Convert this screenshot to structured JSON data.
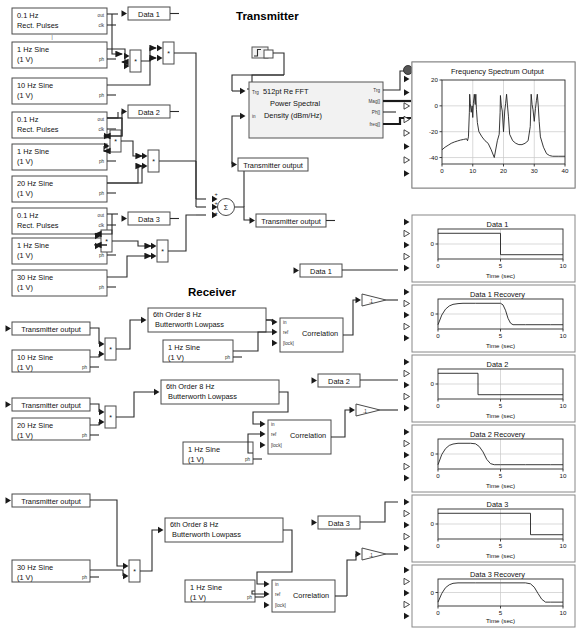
{
  "sections": {
    "transmitter_title": "Transmitter",
    "receiver_title": "Receiver"
  },
  "transmitter": {
    "sources": [
      {
        "id": "src_tx1_pulse",
        "line1": "0.1 Hz",
        "line2": "Rect. Pulses",
        "port_out": "out",
        "port_clk": "clk"
      },
      {
        "id": "src_tx1_s1",
        "line1": "1 Hz Sine",
        "line2": "(1 V)",
        "port_ph": "ph"
      },
      {
        "id": "src_tx1_s10",
        "line1": "10 Hz Sine",
        "line2": "(1 V)",
        "port_ph": "ph"
      },
      {
        "id": "src_tx2_pulse",
        "line1": "0.1 Hz",
        "line2": "Rect. Pulses",
        "port_out": "out",
        "port_clk": "clk"
      },
      {
        "id": "src_tx2_s1",
        "line1": "1 Hz Sine",
        "line2": "(1 V)",
        "port_ph": "ph"
      },
      {
        "id": "src_tx2_s20",
        "line1": "20 Hz Sine",
        "line2": "(1 V)",
        "port_ph": "ph"
      },
      {
        "id": "src_tx3_pulse",
        "line1": "0.1 Hz",
        "line2": "Rect. Pulses",
        "port_out": "out",
        "port_clk": "clk"
      },
      {
        "id": "src_tx3_s1",
        "line1": "1 Hz Sine",
        "line2": "(1 V)",
        "port_ph": "ph"
      },
      {
        "id": "src_tx3_s30",
        "line1": "30 Hz Sine",
        "line2": "(1 V)",
        "port_ph": "ph"
      }
    ],
    "goto_tags": [
      "Data 1",
      "Data 2",
      "Data 3"
    ],
    "multiply_symbol": "*",
    "sum_symbol": "Σ",
    "sum_signs": [
      "+",
      "+",
      "+"
    ],
    "transmitter_output_tag": "Transmitter output",
    "fft_block": {
      "line1": "512pt Re FFT",
      "line2": "Power Spectral",
      "line3": "Density (dBm/Hz)",
      "in_ports": [
        "Trg",
        "in"
      ],
      "out_ports": [
        "Trg",
        "Mag[]",
        "Ph[]",
        "freq[]"
      ]
    }
  },
  "receiver": {
    "chains": [
      {
        "tx_tag": "Transmitter output",
        "mixer_sine_l1": "10 Hz Sine",
        "mixer_sine_l2": "(1 V)",
        "filter_l1": "6th Order 8 Hz",
        "filter_l2": "Butterworth Lowpass",
        "ref_sine_l1": "1 Hz Sine",
        "ref_sine_l2": "(1 V)",
        "corr_label": "Correlation",
        "corr_ports": [
          "in",
          "ref",
          "[lock]"
        ],
        "gain": ".1",
        "goto_tag": "Data 1"
      },
      {
        "tx_tag": "Transmitter output",
        "mixer_sine_l1": "20 Hz Sine",
        "mixer_sine_l2": "(1 V)",
        "filter_l1": "6th Order 8 Hz",
        "filter_l2": "Butterworth Lowpass",
        "ref_sine_l1": "1 Hz Sine",
        "ref_sine_l2": "(1 V)",
        "corr_label": "Correlation",
        "corr_ports": [
          "in",
          "ref",
          "[lock]"
        ],
        "gain": ".1",
        "goto_tag": "Data 2"
      },
      {
        "tx_tag": "Transmitter output",
        "mixer_sine_l1": "30 Hz Sine",
        "mixer_sine_l2": "(1 V)",
        "filter_l1": "6th Order 8 Hz",
        "filter_l2": "Butterworth Lowpass",
        "ref_sine_l1": "1 Hz Sine",
        "ref_sine_l2": "(1 V)",
        "corr_label": "Correlation",
        "corr_ports": [
          "in",
          "ref",
          "[lock]"
        ],
        "gain": ".1",
        "goto_tag": "Data 3"
      }
    ]
  },
  "chart_data": [
    {
      "id": "spectrum",
      "type": "line",
      "title": "Frequency Spectrum Output",
      "xlabel": "",
      "ylabel": "",
      "xlim": [
        0,
        40
      ],
      "ylim": [
        -45,
        20
      ],
      "xticks": [
        0,
        10,
        20,
        30,
        40
      ],
      "yticks": [
        -40,
        -20,
        0,
        20
      ],
      "grid": true,
      "annotations": [
        "peaks near 9 and 11 Hz",
        "peaks near 19 and 21 Hz",
        "peaks near 29 and 31 Hz"
      ],
      "x": [
        0,
        1,
        2,
        3,
        4,
        5,
        6,
        7,
        8,
        8.3,
        8.6,
        8.9,
        9.0,
        9.2,
        9.5,
        9.8,
        10,
        10.2,
        10.5,
        10.8,
        11,
        11.2,
        11.5,
        12,
        13,
        14,
        15,
        16,
        17,
        18,
        18.6,
        18.9,
        19,
        19.3,
        19.6,
        20,
        20.4,
        20.7,
        21,
        21.3,
        21.6,
        22,
        23,
        24,
        25,
        26,
        27,
        28,
        28.7,
        29,
        29.3,
        29.6,
        30,
        30.4,
        30.7,
        31,
        31.3,
        31.6,
        32,
        33,
        34,
        35,
        36,
        38,
        40
      ],
      "y": [
        -34,
        -32,
        -30.5,
        -29,
        -28,
        -27.2,
        -26.5,
        -26,
        -25.5,
        -27,
        -24,
        -5,
        9,
        2,
        -5,
        0,
        -9,
        2,
        9,
        1,
        9,
        -3,
        -13,
        -20,
        -24,
        -27,
        -29,
        -34,
        -40,
        -27,
        -22,
        -5,
        8,
        0,
        -4,
        -20,
        -4,
        2,
        9,
        0,
        -8,
        -22,
        -27,
        -29,
        -30,
        -30,
        -29,
        -27,
        -16,
        9,
        1,
        -3,
        -12,
        -2,
        4,
        9,
        0,
        -12,
        -24,
        -32,
        -37,
        -38.5,
        -39,
        -39,
        -39
      ]
    },
    {
      "id": "data1",
      "type": "line",
      "title": "Data 1",
      "xlabel": "Time (sec)",
      "ylabel": "",
      "xlim": [
        0,
        10
      ],
      "ylim": [
        -1.4,
        1.4
      ],
      "xticks": [
        0,
        5,
        10
      ],
      "yticks": [
        0
      ],
      "ytick_labels": [
        "0"
      ],
      "grid": true,
      "x": [
        0,
        5,
        5,
        10
      ],
      "y": [
        1,
        1,
        -1,
        -1
      ]
    },
    {
      "id": "data1_recovery",
      "type": "line",
      "title": "Data 1 Recovery",
      "xlabel": "Time (sec)",
      "ylabel": "",
      "xlim": [
        0,
        10
      ],
      "ylim": [
        -1.4,
        1.4
      ],
      "xticks": [
        0,
        5,
        10
      ],
      "yticks": [
        0
      ],
      "ytick_labels": [
        "0"
      ],
      "grid": true,
      "x": [
        0,
        0.3,
        0.6,
        0.9,
        1.2,
        1.6,
        2,
        3,
        4,
        5,
        5.2,
        5.4,
        5.6,
        5.8,
        6,
        7,
        8,
        9,
        10
      ],
      "y": [
        -1,
        -0.1,
        0.45,
        0.75,
        0.9,
        0.97,
        1,
        1,
        1,
        1,
        0.85,
        0.35,
        -0.4,
        -0.85,
        -1,
        -1,
        -1,
        -1,
        -1
      ]
    },
    {
      "id": "data2",
      "type": "line",
      "title": "Data 2",
      "xlabel": "Time (sec)",
      "ylabel": "",
      "xlim": [
        0,
        10
      ],
      "ylim": [
        -1.4,
        1.4
      ],
      "xticks": [
        0,
        5,
        10
      ],
      "yticks": [
        0
      ],
      "ytick_labels": [
        "0"
      ],
      "grid": true,
      "x": [
        0,
        3.2,
        3.2,
        10
      ],
      "y": [
        1,
        1,
        -1,
        -1
      ]
    },
    {
      "id": "data2_recovery",
      "type": "line",
      "title": "Data 2 Recovery",
      "xlabel": "Time (sec)",
      "ylabel": "",
      "xlim": [
        0,
        10
      ],
      "ylim": [
        -1.4,
        1.4
      ],
      "xticks": [
        0,
        5,
        10
      ],
      "yticks": [
        0
      ],
      "ytick_labels": [
        "0"
      ],
      "grid": true,
      "x": [
        0,
        0.3,
        0.6,
        0.9,
        1.2,
        1.6,
        2,
        2.6,
        3,
        3.3,
        3.6,
        3.9,
        4.2,
        4.5,
        5,
        6,
        7,
        8,
        9,
        10
      ],
      "y": [
        -1,
        -0.05,
        0.5,
        0.8,
        0.93,
        1,
        1,
        1,
        0.95,
        0.7,
        0.2,
        -0.5,
        -0.9,
        -1,
        -1,
        -1,
        -1,
        -1,
        -1,
        -1
      ]
    },
    {
      "id": "data3",
      "type": "line",
      "title": "Data 3",
      "xlabel": "Time (sec)",
      "ylabel": "",
      "xlim": [
        0,
        10
      ],
      "ylim": [
        -1.4,
        1.4
      ],
      "xticks": [
        0,
        5,
        10
      ],
      "yticks": [
        0
      ],
      "ytick_labels": [
        "0"
      ],
      "grid": true,
      "x": [
        0,
        7.4,
        7.4,
        10
      ],
      "y": [
        1,
        1,
        -1,
        -1
      ]
    },
    {
      "id": "data3_recovery",
      "type": "line",
      "title": "Data 3 Recovery",
      "xlabel": "Time (sec)",
      "ylabel": "",
      "xlim": [
        0,
        10
      ],
      "ylim": [
        -1.4,
        1.4
      ],
      "xticks": [
        0,
        5,
        10
      ],
      "yticks": [
        0
      ],
      "ytick_labels": [
        "0"
      ],
      "grid": true,
      "x": [
        0,
        0.3,
        0.6,
        0.9,
        1.2,
        1.6,
        2,
        3,
        4,
        5,
        6,
        7,
        7.4,
        7.7,
        8,
        8.3,
        8.6,
        9,
        10
      ],
      "y": [
        -1,
        -0.1,
        0.5,
        0.8,
        0.95,
        1,
        1,
        1,
        1,
        1,
        1,
        1,
        0.9,
        0.55,
        -0.1,
        -0.7,
        -1,
        -1,
        -1
      ]
    }
  ]
}
